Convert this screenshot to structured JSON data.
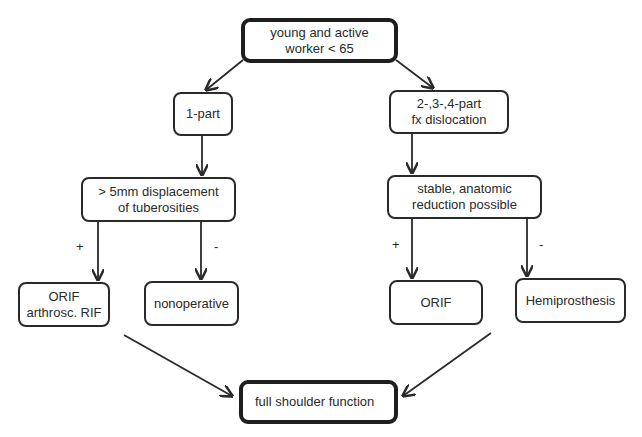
{
  "diagram": {
    "type": "flowchart",
    "nodes": {
      "start": {
        "label": "young and active\nworker < 65"
      },
      "one_part": {
        "label": "1-part"
      },
      "multi_part": {
        "label": "2-,3-,4-part\nfx dislocation"
      },
      "displacement": {
        "label": "> 5mm displacement\nof tuberosities"
      },
      "stable_reduction": {
        "label": "stable, anatomic\nreduction possible"
      },
      "orif_arthrosc": {
        "label": "ORIF\narthrosc. RIF"
      },
      "nonoperative": {
        "label": "nonoperative"
      },
      "orif": {
        "label": "ORIF"
      },
      "hemiprosthesis": {
        "label": "Hemiprosthesis"
      },
      "outcome": {
        "label": "full shoulder function"
      }
    },
    "edge_labels": {
      "displacement_yes": "+",
      "displacement_no": "-",
      "reduction_yes": "+",
      "reduction_no": "-"
    },
    "edges": [
      {
        "from": "start",
        "to": "one_part"
      },
      {
        "from": "start",
        "to": "multi_part"
      },
      {
        "from": "one_part",
        "to": "displacement"
      },
      {
        "from": "multi_part",
        "to": "stable_reduction"
      },
      {
        "from": "displacement",
        "to": "orif_arthrosc",
        "label": "+"
      },
      {
        "from": "displacement",
        "to": "nonoperative",
        "label": "-"
      },
      {
        "from": "stable_reduction",
        "to": "orif",
        "label": "+"
      },
      {
        "from": "stable_reduction",
        "to": "hemiprosthesis",
        "label": "-"
      },
      {
        "from": "orif_arthrosc",
        "to": "outcome"
      },
      {
        "from": "hemiprosthesis",
        "to": "outcome"
      }
    ],
    "colors": {
      "stroke": "#2a2a2a",
      "background": "#ffffff"
    }
  }
}
